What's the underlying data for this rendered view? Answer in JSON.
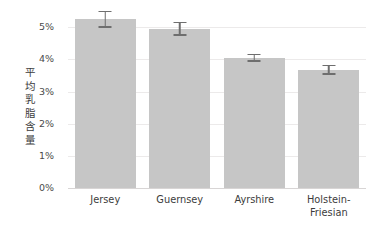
{
  "chart_data": {
    "type": "bar",
    "title": "",
    "xlabel": "",
    "ylabel": "平均乳脂含量",
    "categories": [
      "Jersey",
      "Guernsey",
      "Ayrshire",
      "Holstein-Friesian"
    ],
    "category_lines": [
      [
        "Jersey"
      ],
      [
        "Guernsey"
      ],
      [
        "Ayrshire"
      ],
      [
        "Holstein-",
        "Friesian"
      ]
    ],
    "values": [
      5.25,
      4.95,
      4.05,
      3.68
    ],
    "errors": [
      0.27,
      0.22,
      0.13,
      0.15
    ],
    "error_low": [
      4.98,
      4.73,
      3.92,
      3.53
    ],
    "error_high": [
      5.52,
      5.17,
      4.18,
      3.83
    ],
    "ylim": [
      0,
      5.6
    ],
    "ytick_values": [
      0,
      1,
      2,
      3,
      4,
      5
    ],
    "ytick_labels": [
      "0%",
      "1%",
      "2%",
      "3%",
      "4%",
      "5%"
    ],
    "grid": true,
    "legend": false,
    "bar_color": "#c6c6c6",
    "error_color": "#6e6e6e",
    "grid_color": "#eceaea",
    "axis_color": "#d8d5d5",
    "text_color": "#3c3c3c",
    "background": "#ffffff"
  }
}
